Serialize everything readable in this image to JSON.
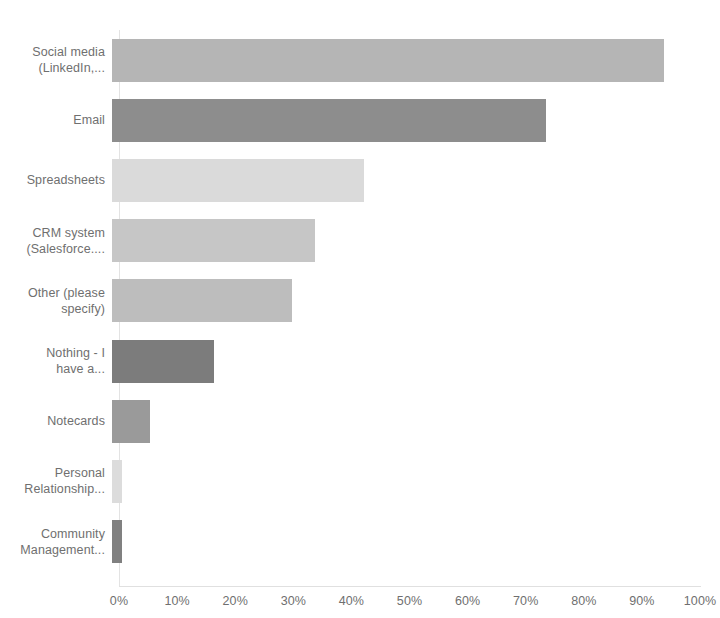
{
  "chart_data": {
    "type": "bar",
    "orientation": "horizontal",
    "title": "",
    "subtitle": "",
    "xlabel": "",
    "ylabel": "",
    "xlim": [
      0,
      100
    ],
    "grid": false,
    "legend": false,
    "value_suffix": "%",
    "categories": [
      "Social media\n(LinkedIn,...",
      "Email",
      "Spreadsheets",
      "CRM system\n(Salesforce....",
      "Other (please\nspecify)",
      "Nothing - I\nhave a...",
      "Notecards",
      "Personal\nRelationship...",
      "Community\nManagement..."
    ],
    "values": [
      95,
      74.7,
      43.3,
      35,
      31,
      17.5,
      6.5,
      1.8,
      1.8
    ],
    "bar_colors": [
      "#b5b5b5",
      "#8d8d8d",
      "#dadada",
      "#c6c6c6",
      "#bdbdbd",
      "#7c7c7c",
      "#9a9a9a",
      "#dcdcdc",
      "#808080"
    ],
    "xticks": [
      {
        "value": 0,
        "label": "0%"
      },
      {
        "value": 10,
        "label": "10%"
      },
      {
        "value": 20,
        "label": "20%"
      },
      {
        "value": 30,
        "label": "30%"
      },
      {
        "value": 40,
        "label": "40%"
      },
      {
        "value": 50,
        "label": "50%"
      },
      {
        "value": 60,
        "label": "60%"
      },
      {
        "value": 70,
        "label": "70%"
      },
      {
        "value": 80,
        "label": "80%"
      },
      {
        "value": 90,
        "label": "90%"
      },
      {
        "value": 100,
        "label": "100%"
      }
    ],
    "colors": {
      "background": "#ffffff",
      "axis_line": "#e3e3e3",
      "tick_text": "#6f6f6f",
      "label_text": "#6f6f6f"
    }
  }
}
